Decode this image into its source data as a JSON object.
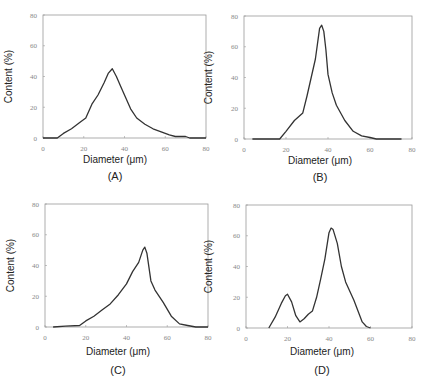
{
  "figure": {
    "panels": [
      "(A)",
      "(B)",
      "(C)",
      "(D)"
    ]
  },
  "chart_data": [
    {
      "type": "line",
      "panel": "(A)",
      "title": "",
      "xlabel": "Diameter (μm)",
      "ylabel": "Content (%)",
      "xlim": [
        0,
        80
      ],
      "ylim": [
        0,
        80
      ],
      "xticks": [
        0,
        20,
        40,
        60,
        80
      ],
      "yticks": [
        0,
        20,
        40,
        60,
        80
      ],
      "grid": false,
      "x": [
        0,
        7,
        10,
        14,
        18,
        21,
        24,
        27,
        30,
        32,
        34,
        36,
        38,
        40,
        43,
        46,
        50,
        54,
        58,
        62,
        65,
        70,
        72,
        76,
        80
      ],
      "y": [
        0,
        0,
        3,
        6,
        10,
        13,
        22,
        28,
        36,
        42,
        45,
        40,
        34,
        28,
        19,
        13,
        9,
        6,
        4,
        2,
        1,
        1,
        0,
        0,
        0
      ]
    },
    {
      "type": "line",
      "panel": "(B)",
      "title": "",
      "xlabel": "Diameter (μm)",
      "ylabel": "Content (%)",
      "xlim": [
        0,
        80
      ],
      "ylim": [
        0,
        80
      ],
      "xticks": [
        0,
        20,
        40,
        60,
        80
      ],
      "yticks": [
        0,
        20,
        40,
        60,
        80
      ],
      "grid": false,
      "x": [
        4,
        10,
        17,
        20,
        24,
        28,
        30,
        32,
        34,
        35,
        36,
        37,
        38,
        39,
        40,
        42,
        44,
        48,
        52,
        56,
        60,
        63,
        70,
        75
      ],
      "y": [
        0,
        0,
        0,
        5,
        12,
        17,
        28,
        40,
        52,
        62,
        72,
        74,
        70,
        58,
        42,
        30,
        22,
        12,
        5,
        2,
        1,
        0,
        0,
        0
      ]
    },
    {
      "type": "line",
      "panel": "(C)",
      "title": "",
      "xlabel": "Diameter (μm)",
      "ylabel": "Content (%)",
      "xlim": [
        0,
        80
      ],
      "ylim": [
        0,
        80
      ],
      "xticks": [
        0,
        20,
        40,
        60,
        80
      ],
      "yticks": [
        0,
        20,
        40,
        60,
        80
      ],
      "grid": false,
      "x": [
        4,
        10,
        17,
        20,
        24,
        28,
        32,
        36,
        40,
        43,
        46,
        48,
        49,
        50,
        52,
        54,
        58,
        62,
        66,
        70,
        74,
        80
      ],
      "y": [
        0,
        0.5,
        1,
        4,
        7,
        11,
        15,
        21,
        28,
        36,
        42,
        50,
        52,
        48,
        30,
        24,
        16,
        7,
        2,
        1,
        0,
        0
      ]
    },
    {
      "type": "line",
      "panel": "(D)",
      "title": "",
      "xlabel": "Diameter (μm)",
      "ylabel": "Content (%)",
      "xlim": [
        0,
        80
      ],
      "ylim": [
        0,
        80
      ],
      "xticks": [
        0,
        20,
        40,
        60,
        80
      ],
      "yticks": [
        0,
        20,
        40,
        60,
        80
      ],
      "grid": false,
      "x": [
        11,
        14,
        17,
        19,
        20,
        22,
        24,
        26,
        28,
        30,
        32,
        34,
        36,
        38,
        40,
        41,
        42,
        44,
        46,
        48,
        52,
        56,
        58,
        60
      ],
      "y": [
        0,
        7,
        16,
        21,
        22,
        17,
        8,
        4,
        6,
        9,
        11,
        20,
        32,
        45,
        62,
        65,
        64,
        55,
        40,
        30,
        18,
        4,
        1,
        0
      ]
    }
  ]
}
